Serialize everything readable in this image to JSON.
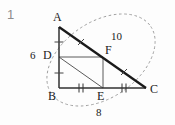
{
  "problem": {
    "number": "1"
  },
  "figure": {
    "type": "geometry-diagram",
    "background_color": "#fdfdfd",
    "stroke_color": "#1a1a1a",
    "thin_stroke_color": "#555555",
    "dashed_stroke_color": "#999999",
    "number_color": "#8d8d8d",
    "vertices": [
      {
        "name": "A",
        "label": "A",
        "x": 59,
        "y": 27,
        "label_x": 54,
        "label_y": 13
      },
      {
        "name": "B",
        "label": "B",
        "x": 59,
        "y": 88,
        "label_x": 50,
        "label_y": 92
      },
      {
        "name": "C",
        "label": "C",
        "x": 146,
        "y": 88,
        "label_x": 151,
        "label_y": 86
      },
      {
        "name": "D",
        "label": "D",
        "x": 59,
        "y": 57,
        "label_x": 44,
        "label_y": 51
      },
      {
        "name": "E",
        "label": "E",
        "x": 103,
        "y": 88,
        "label_x": 98,
        "label_y": 92
      },
      {
        "name": "F",
        "label": "F",
        "x": 103,
        "y": 57,
        "label_x": 106,
        "label_y": 45
      }
    ],
    "segments": [
      {
        "name": "segment-AB",
        "from": "A",
        "to": "B",
        "style": "solid",
        "weight": "medium",
        "ticks": 0
      },
      {
        "name": "segment-BC",
        "from": "B",
        "to": "C",
        "style": "solid",
        "weight": "medium",
        "ticks": 0
      },
      {
        "name": "segment-AC",
        "from": "A",
        "to": "C",
        "style": "solid",
        "weight": "bold",
        "ticks": 0
      },
      {
        "name": "segment-DF",
        "from": "D",
        "to": "F",
        "style": "solid",
        "weight": "thin",
        "ticks": 0
      },
      {
        "name": "segment-FE",
        "from": "F",
        "to": "E",
        "style": "solid",
        "weight": "thin",
        "ticks": 0
      },
      {
        "name": "segment-DE",
        "from": "D",
        "to": "E",
        "style": "solid",
        "weight": "thin",
        "ticks": 0
      }
    ],
    "tick_marks": [
      {
        "name": "tick-AD",
        "on": "segment-AD",
        "x": 59,
        "y": 42,
        "count": 1,
        "orientation": "horizontal"
      },
      {
        "name": "tick-DB",
        "on": "segment-DB",
        "x": 59,
        "y": 73,
        "count": 1,
        "orientation": "horizontal"
      },
      {
        "name": "tick-BE",
        "on": "segment-BE",
        "x": 81,
        "y": 88,
        "count": 2,
        "orientation": "vertical"
      },
      {
        "name": "tick-EC",
        "on": "segment-EC",
        "x": 124,
        "y": 88,
        "count": 2,
        "orientation": "vertical"
      },
      {
        "name": "tick-AF",
        "on": "segment-AF",
        "x": 81,
        "y": 42,
        "count": 1,
        "orientation": "perpendicular"
      },
      {
        "name": "tick-FC",
        "on": "segment-FC",
        "x": 124,
        "y": 72,
        "count": 1,
        "orientation": "perpendicular"
      }
    ],
    "measure_labels": [
      {
        "name": "measure-AB",
        "text": "6",
        "x": 32,
        "y": 51,
        "refers_to": "side AB"
      },
      {
        "name": "measure-AC",
        "text": "10",
        "x": 112,
        "y": 33,
        "refers_to": "hypotenuse AC"
      },
      {
        "name": "measure-BC",
        "text": "8",
        "x": 97,
        "y": 110,
        "refers_to": "side BC"
      }
    ],
    "ellipse": {
      "name": "dashed-ellipse",
      "center_x": 101,
      "center_y": 60,
      "radius_x": 60,
      "radius_y": 38,
      "rotation_deg": -34,
      "style": "dashed"
    }
  }
}
